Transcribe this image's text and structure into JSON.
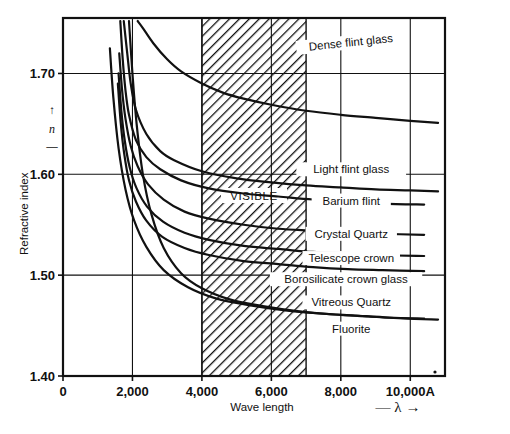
{
  "figure": {
    "background_color": "#ffffff",
    "ink_color": "#111111"
  },
  "axes": {
    "y_title": "Refractive index",
    "y_symbol": "n",
    "y_symbol_arrow_up": "↑",
    "y_symbol_dash": "—",
    "x_title": "Wave length",
    "x_symbol": "— λ →",
    "x_unit_suffix": "A"
  },
  "band": {
    "label": "VISIBLE",
    "start": 4000,
    "end": 7000,
    "fill": "hatched"
  },
  "chart_data": {
    "type": "line",
    "xlabel": "Wave length",
    "ylabel": "Refractive index",
    "x_unit": "Angstrom",
    "xlim": [
      0,
      11000
    ],
    "ylim": [
      1.4,
      1.755
    ],
    "xticks": [
      0,
      2000,
      4000,
      6000,
      8000,
      10000
    ],
    "xtick_labels": [
      "0",
      "2,000",
      "4,000",
      "6,000",
      "8,000",
      "10,000A"
    ],
    "yticks": [
      1.4,
      1.5,
      1.6,
      1.7
    ],
    "ytick_labels": [
      "1.40",
      "1.50",
      "1.60",
      "1.70"
    ],
    "grid": true,
    "legend": "inline-labels",
    "annotations": [
      {
        "text": "VISIBLE",
        "x": 5000,
        "y": 1.607
      }
    ],
    "series": [
      {
        "name": "Dense flint glass",
        "label_x": 8300,
        "label_y": 1.727,
        "points": [
          [
            2150,
            1.752
          ],
          [
            2300,
            1.745
          ],
          [
            2600,
            1.73
          ],
          [
            3000,
            1.714
          ],
          [
            3400,
            1.702
          ],
          [
            4000,
            1.69
          ],
          [
            4600,
            1.681
          ],
          [
            5200,
            1.675
          ],
          [
            6000,
            1.669
          ],
          [
            7000,
            1.663
          ],
          [
            8000,
            1.659
          ],
          [
            9000,
            1.656
          ],
          [
            10000,
            1.653
          ],
          [
            10800,
            1.651
          ]
        ]
      },
      {
        "name": "Light flint glass",
        "label_x": 8300,
        "label_y": 1.601,
        "points": [
          [
            1750,
            1.752
          ],
          [
            1850,
            1.72
          ],
          [
            1950,
            1.69
          ],
          [
            2100,
            1.664
          ],
          [
            2400,
            1.64
          ],
          [
            2800,
            1.623
          ],
          [
            3200,
            1.614
          ],
          [
            4000,
            1.603
          ],
          [
            5000,
            1.596
          ],
          [
            6000,
            1.592
          ],
          [
            7000,
            1.589
          ],
          [
            8000,
            1.587
          ],
          [
            9000,
            1.585
          ],
          [
            10000,
            1.584
          ],
          [
            10800,
            1.583
          ]
        ]
      },
      {
        "name": "Barium flint",
        "label_x": 8300,
        "label_y": 1.57,
        "points": [
          [
            1650,
            1.752
          ],
          [
            1720,
            1.714
          ],
          [
            1800,
            1.683
          ],
          [
            1900,
            1.659
          ],
          [
            2100,
            1.634
          ],
          [
            2400,
            1.617
          ],
          [
            2800,
            1.605
          ],
          [
            3400,
            1.594
          ],
          [
            4200,
            1.586
          ],
          [
            5200,
            1.581
          ],
          [
            6200,
            1.578
          ],
          [
            7200,
            1.575
          ],
          [
            8200,
            1.573
          ],
          [
            9200,
            1.571
          ],
          [
            10400,
            1.57
          ]
        ]
      },
      {
        "name": "Crystal Quartz",
        "label_x": 8300,
        "label_y": 1.537,
        "points": [
          [
            1620,
            1.72
          ],
          [
            1700,
            1.684
          ],
          [
            1800,
            1.655
          ],
          [
            1950,
            1.628
          ],
          [
            2150,
            1.608
          ],
          [
            2450,
            1.59
          ],
          [
            2900,
            1.575
          ],
          [
            3500,
            1.563
          ],
          [
            4200,
            1.556
          ],
          [
            5200,
            1.55
          ],
          [
            6200,
            1.546
          ],
          [
            7200,
            1.544
          ],
          [
            8200,
            1.542
          ],
          [
            9200,
            1.541
          ],
          [
            10400,
            1.54
          ]
        ]
      },
      {
        "name": "Telescope crown",
        "label_x": 8300,
        "label_y": 1.513,
        "points": [
          [
            1600,
            1.7
          ],
          [
            1680,
            1.663
          ],
          [
            1780,
            1.633
          ],
          [
            1920,
            1.607
          ],
          [
            2120,
            1.586
          ],
          [
            2420,
            1.568
          ],
          [
            2880,
            1.553
          ],
          [
            3500,
            1.542
          ],
          [
            4200,
            1.535
          ],
          [
            5200,
            1.529
          ],
          [
            6200,
            1.526
          ],
          [
            7200,
            1.523
          ],
          [
            8200,
            1.522
          ],
          [
            9200,
            1.52
          ],
          [
            10400,
            1.519
          ]
        ]
      },
      {
        "name": "Borosilicate crown glass",
        "label_x": 8150,
        "label_y": 1.492,
        "points": [
          [
            1580,
            1.69
          ],
          [
            1660,
            1.652
          ],
          [
            1760,
            1.621
          ],
          [
            1900,
            1.594
          ],
          [
            2100,
            1.573
          ],
          [
            2400,
            1.554
          ],
          [
            2860,
            1.538
          ],
          [
            3500,
            1.527
          ],
          [
            4200,
            1.52
          ],
          [
            5200,
            1.514
          ],
          [
            6200,
            1.511
          ],
          [
            7200,
            1.508
          ],
          [
            8200,
            1.506
          ],
          [
            9200,
            1.505
          ],
          [
            10400,
            1.504
          ]
        ]
      },
      {
        "name": "Vitreous Quartz",
        "label_x": 8300,
        "label_y": 1.469,
        "points": [
          [
            1350,
            1.725
          ],
          [
            1450,
            1.676
          ],
          [
            1600,
            1.626
          ],
          [
            1800,
            1.585
          ],
          [
            2050,
            1.554
          ],
          [
            2400,
            1.528
          ],
          [
            2900,
            1.505
          ],
          [
            3600,
            1.488
          ],
          [
            4400,
            1.477
          ],
          [
            5400,
            1.47
          ],
          [
            6400,
            1.465
          ],
          [
            7400,
            1.462
          ],
          [
            8400,
            1.46
          ],
          [
            9400,
            1.458
          ],
          [
            10400,
            1.457
          ]
        ]
      },
      {
        "name": "Fluorite",
        "label_x": 8300,
        "label_y": 1.443,
        "points": [
          [
            1900,
            1.752
          ],
          [
            2000,
            1.7
          ],
          [
            2120,
            1.65
          ],
          [
            2300,
            1.6
          ],
          [
            2550,
            1.56
          ],
          [
            2900,
            1.527
          ],
          [
            3400,
            1.502
          ],
          [
            4000,
            1.487
          ],
          [
            4800,
            1.476
          ],
          [
            5800,
            1.469
          ],
          [
            6800,
            1.464
          ],
          [
            7800,
            1.461
          ],
          [
            8800,
            1.459
          ],
          [
            9800,
            1.457
          ],
          [
            10800,
            1.456
          ]
        ]
      }
    ]
  }
}
